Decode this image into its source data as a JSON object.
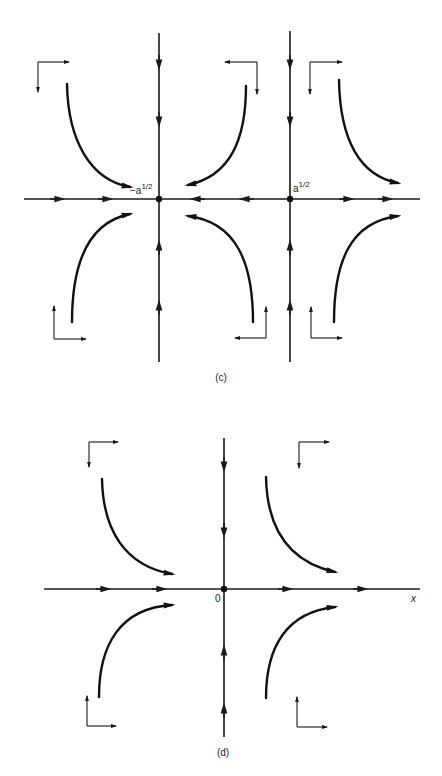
{
  "figure": {
    "panels": [
      {
        "id": "c",
        "caption": "(c)",
        "fixed_points": [
          {
            "label": "−a",
            "exponent": "1/2",
            "type": "saddle"
          },
          {
            "label": "a",
            "exponent": "1/2",
            "type": "saddle"
          }
        ],
        "x_axis_flow": [
          "right",
          "right",
          "left",
          "left",
          "right",
          "right"
        ],
        "description": "Phase portrait with two saddle points at x = -a^(1/2) and x = a^(1/2)"
      },
      {
        "id": "d",
        "caption": "(d)",
        "fixed_points": [
          {
            "label": "0",
            "type": "saddle"
          }
        ],
        "axis_label_x": "x",
        "x_axis_flow": [
          "right",
          "right",
          "right",
          "right"
        ],
        "description": "Phase portrait with single degenerate fixed point at origin"
      }
    ],
    "colors": {
      "ink": "#1a1a1a",
      "background": "#ffffff"
    }
  }
}
